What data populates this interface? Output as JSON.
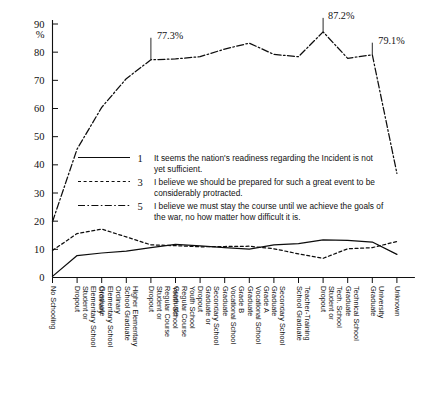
{
  "chart_data": {
    "type": "line",
    "title": "",
    "xlabel": "",
    "ylabel": "%",
    "ylim": [
      0,
      90
    ],
    "grid": false,
    "legend_position": "center",
    "y_unit": "%",
    "yticks": [
      0,
      10,
      20,
      30,
      40,
      50,
      60,
      70,
      80,
      90
    ],
    "ytick_labels": [
      "0",
      "10",
      "20",
      "30",
      "40",
      "50",
      "60",
      "70",
      "80",
      "90"
    ],
    "categories": [
      "No Schooling",
      "Ordinary Elementary School Student or Dropout",
      "Ordinary Elementary School Graduate",
      "Higher Elementary School Graduate",
      "Youth School Regular Course Student or Dropout",
      "Youth School Regular Course Graduate",
      "Secondary School Graduate or Dropout",
      "Grade B Vocational School Graduate",
      "Grade A Vocational School Graduate",
      "Secondary School Graduate",
      "Teacher-Training School Graduate",
      "Tech. School Student or Dropout",
      "Technical School Graduate",
      "University Graduate",
      "Unknown"
    ],
    "series": [
      {
        "name": "1",
        "label": "It seems the nation's readiness regarding the Incident is not yet sufficient.",
        "style": "solid",
        "values": [
          0.4,
          7.8,
          8.7,
          9.4,
          10.6,
          11.8,
          11.2,
          10.6,
          10.1,
          11.6,
          12.0,
          13.4,
          13.2,
          12.6,
          8.2
        ]
      },
      {
        "name": "3",
        "label": "I believe we should be prepared for such a great event to be considerably protracted.",
        "style": "dotted",
        "values": [
          9.6,
          15.6,
          17.2,
          14.4,
          11.6,
          11.3,
          10.9,
          11.0,
          11.1,
          10.2,
          8.4,
          6.8,
          10.2,
          10.6,
          12.8
        ]
      },
      {
        "name": "5",
        "label": "I believe we must stay the course until we achieve the goals of the war, no how matter how difficult it is.",
        "style": "dash-dot",
        "values": [
          19.8,
          45.6,
          60.4,
          70.6,
          77.3,
          77.6,
          78.4,
          81.1,
          83.2,
          79.2,
          78.4,
          87.2,
          77.8,
          79.1,
          37.0
        ]
      }
    ],
    "annotations": [
      {
        "text": "77.3%",
        "series": "5",
        "category_index": 4,
        "value": 77.3
      },
      {
        "text": "87.2%",
        "series": "5",
        "category_index": 11,
        "value": 87.2
      },
      {
        "text": "79.1%",
        "series": "5",
        "category_index": 13,
        "value": 79.1
      }
    ]
  },
  "legend": {
    "entries": [
      {
        "key": "1",
        "style": "solid",
        "description": "It seems the nation's readiness regarding the Incident is not yet sufficient."
      },
      {
        "key": "3",
        "style": "dotted",
        "description": "I believe we should be prepared for such a great event to be considerably protracted."
      },
      {
        "key": "5",
        "style": "dash-dot",
        "description": "I believe we must stay the course until we achieve the goals of the war, no how matter how difficult it is."
      }
    ]
  }
}
